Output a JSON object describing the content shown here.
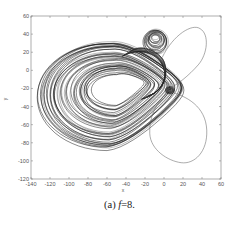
{
  "chart_data": {
    "type": "line",
    "title": "",
    "xlabel": "x",
    "ylabel": "y",
    "xlim": [
      -140,
      60
    ],
    "ylim": [
      -120,
      60
    ],
    "xticks": [
      -140,
      -120,
      -100,
      -80,
      -60,
      -40,
      -20,
      0,
      20,
      40,
      60
    ],
    "yticks": [
      60,
      40,
      20,
      0,
      -20,
      -40,
      -60,
      -80,
      -100,
      -120
    ],
    "grid": false,
    "legend": null,
    "series": [
      {
        "name": "chaotic attractor (dense trajectory)",
        "style": "dense black line bundle",
        "left_lobe": {
          "x_range": [
            -127,
            2
          ],
          "y_range": [
            -88,
            32
          ],
          "center": [
            -58,
            -25
          ]
        },
        "small_upper_loop": {
          "center": [
            -10,
            36
          ],
          "x_range": [
            -22,
            2
          ],
          "y_range": [
            18,
            50
          ]
        }
      },
      {
        "name": "periodic orbit (thin line)",
        "style": "thin gray line",
        "upper_right_lobe": {
          "x_range": [
            -2,
            45
          ],
          "y_range": [
            -20,
            48
          ],
          "top_point": [
            33,
            48
          ],
          "right_point": [
            45,
            23
          ]
        },
        "lower_right_lobe": {
          "x_range": [
            -15,
            45
          ],
          "y_range": [
            -102,
            -25
          ],
          "bottom_point": [
            20,
            -102
          ],
          "right_point": [
            45,
            -65
          ]
        }
      }
    ]
  },
  "caption": {
    "prefix": "(a) ",
    "variable": "f",
    "suffix": "=8."
  }
}
